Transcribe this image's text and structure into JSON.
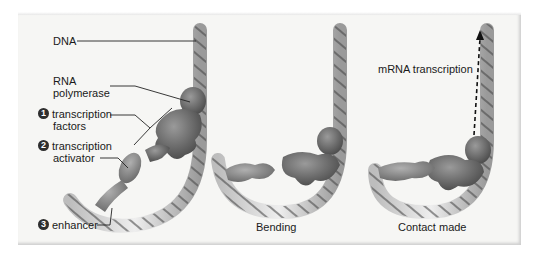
{
  "labels": {
    "dna": "DNA",
    "rna_polymerase_line1": "RNA",
    "rna_polymerase_line2": "polymerase",
    "transcription_factors_line1": "transcription",
    "transcription_factors_line2": "factors",
    "transcription_activator_line1": "transcription",
    "transcription_activator_line2": "activator",
    "enhancer": "enhancer",
    "mrna_transcription": "mRNA transcription"
  },
  "step_numbers": {
    "step1": "1",
    "step2": "2",
    "step3": "3"
  },
  "captions": {
    "panel2": "Bending",
    "panel3": "Contact made"
  },
  "colors": {
    "dna_strand": "#d9d9d9",
    "protein": "#6e6e6e",
    "panel_bg": "#f6f6f4"
  }
}
